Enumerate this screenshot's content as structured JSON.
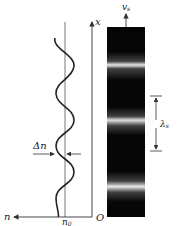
{
  "diagram": {
    "type": "refractive-index-modulation-and-fringe-pattern",
    "labels": {
      "x_axis": "x",
      "n_axis": "n",
      "origin": "O",
      "n0_base": "n",
      "n0_sub": "0",
      "delta_n": "Δn",
      "v_base": "v",
      "v_sub": "s",
      "lambda_base": "λ",
      "lambda_sub": "s"
    },
    "colors": {
      "line": "#333333",
      "bar_dark": "#050505",
      "bar_bright": "#e8e8e8",
      "background": "#ffffff"
    },
    "fringe_bar": {
      "x": 107,
      "y": 27,
      "width": 38,
      "height": 190,
      "bright_band_y": [
        65,
        120,
        181
      ]
    },
    "wave": {
      "center_x": 65,
      "amplitude": 9,
      "y_top": 38,
      "y_bottom": 217,
      "cycles": 3.25
    }
  }
}
